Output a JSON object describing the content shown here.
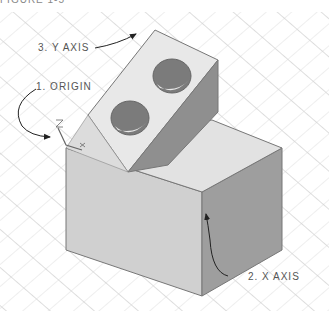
{
  "figure": {
    "title_partial": "FIGURE 1-5",
    "callouts": [
      {
        "id": "origin",
        "text": "1. ORIGIN"
      },
      {
        "id": "x-axis",
        "text": "2. X AXIS"
      },
      {
        "id": "y-axis",
        "text": "3. Y AXIS"
      }
    ],
    "ucs_icon": {
      "z_label": "Z",
      "x_label": "X"
    },
    "colors": {
      "grid": "#cfcfcf",
      "top_face": "#e6e6e6",
      "front_face": "#d2d2d2",
      "side_face": "#9c9c9c",
      "hole": "#7a7a7a",
      "edge": "#666666",
      "text": "#555555"
    }
  }
}
